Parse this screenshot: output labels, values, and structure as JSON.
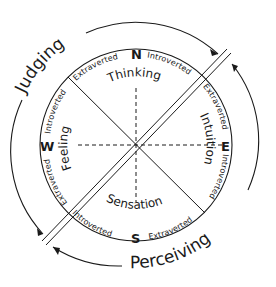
{
  "diagram": {
    "title_arcs": {
      "judging": "Judging",
      "perceiving": "Perceiving"
    },
    "directions": {
      "north": "N",
      "east": "E",
      "south": "S",
      "west": "W"
    },
    "functions": {
      "thinking": "Thinking",
      "intuition": "Intuition",
      "sensation": "Sensation",
      "feeling": "Feeling"
    },
    "attitude_labels": {
      "north_left": "Extraverted",
      "north_right": "Introverted",
      "east_top": "Extraverted",
      "east_bottom": "Introverted",
      "south_left": "Introverted",
      "south_right": "Extraverted",
      "west_top": "Introverted",
      "west_bottom": "Extraverted"
    },
    "colors": {
      "ink": "#1a1a1a",
      "background": "#ffffff"
    }
  }
}
